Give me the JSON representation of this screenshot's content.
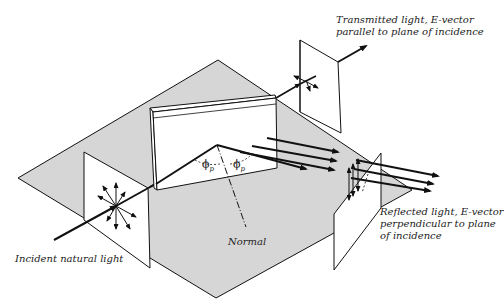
{
  "diagram": {
    "colors": {
      "plane_fill": "#d6d6d6",
      "panel_fill": "#ffffff",
      "line": "#111111"
    },
    "labels": {
      "transmitted": [
        "Transmitted light, E-vector",
        "parallel to plane of incidence"
      ],
      "reflected": [
        "Reflected light, E-vector",
        "perpendicular to plane",
        "of incidence"
      ],
      "incident": "Incident natural light",
      "normal": "Normal",
      "angle_symbol": "ϕ",
      "angle_subscript": "p"
    }
  }
}
